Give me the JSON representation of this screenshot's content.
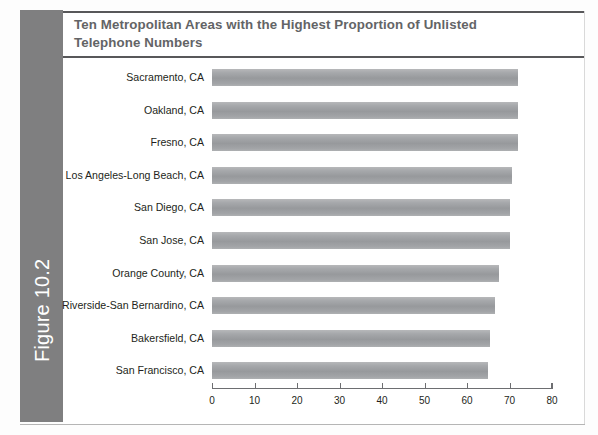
{
  "figure": {
    "tab_label": "Figure 10.2",
    "title": "Ten Metropolitan Areas with the Highest Proportion of Unlisted Telephone Numbers",
    "tab_color": "#7f7f80",
    "rule_color": "#58585a",
    "title_color": "#636466",
    "bar_color": "#9b9da0"
  },
  "chart_data": {
    "type": "bar",
    "orientation": "horizontal",
    "title": "Ten Metropolitan Areas with the Highest Proportion of Unlisted Telephone Numbers",
    "xlabel": "",
    "ylabel": "",
    "xlim": [
      0,
      80
    ],
    "grid": false,
    "legend": null,
    "xticks": [
      0,
      10,
      20,
      30,
      40,
      50,
      60,
      70,
      80
    ],
    "xtick_labels": [
      "0",
      "10",
      "20",
      "30",
      "40",
      "50",
      "60",
      "70",
      "80"
    ],
    "categories": [
      "Sacramento, CA",
      "Oakland, CA",
      "Fresno, CA",
      "Los Angeles-Long Beach, CA",
      "San Diego, CA",
      "San Jose, CA",
      "Orange County, CA",
      "Riverside-San Bernardino, CA",
      "Bakersfield, CA",
      "San Francisco, CA"
    ],
    "values": [
      72,
      72,
      72,
      70.5,
      70,
      70,
      67.5,
      66.5,
      65.5,
      65
    ]
  }
}
